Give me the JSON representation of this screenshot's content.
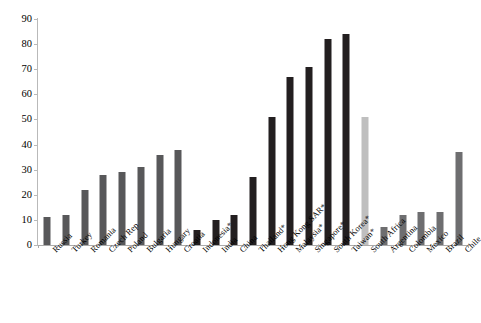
{
  "chart_data": {
    "type": "bar",
    "title": "",
    "subtitle": "",
    "xlabel": "",
    "ylabel": "",
    "ylim": [
      0,
      90
    ],
    "ytick_step": 10,
    "yticks": [
      0,
      10,
      20,
      30,
      40,
      50,
      60,
      70,
      80,
      90
    ],
    "ytick_labels": [
      "0",
      "10",
      "20",
      "30",
      "40",
      "50",
      "60",
      "70",
      "80",
      "90"
    ],
    "grid": false,
    "legend": null,
    "legend_position": "none",
    "categories": [
      "Russia",
      "Turkey",
      "Romania",
      "Czech Rep",
      "Poland",
      "Bulgaria",
      "Hungary",
      "Croatia",
      "Indonesia*",
      "India",
      "China",
      "Thailand*",
      "Hong Kong SAR*",
      "Malaysia*",
      "Singapore*",
      "South Korea*",
      "Taiwan*",
      "South Africa",
      "Argentina",
      "Colombia",
      "Mexico",
      "Brazil",
      "Chile"
    ],
    "values": [
      11,
      12,
      22,
      28,
      29,
      31,
      36,
      38,
      6,
      10,
      12,
      27,
      51,
      67,
      71,
      82,
      84,
      51,
      7,
      12,
      13,
      13,
      37
    ],
    "bar_colors": [
      "#58585a",
      "#58585a",
      "#58585a",
      "#58585a",
      "#58585a",
      "#58585a",
      "#58585a",
      "#58585a",
      "#231f20",
      "#231f20",
      "#231f20",
      "#231f20",
      "#231f20",
      "#231f20",
      "#231f20",
      "#231f20",
      "#231f20",
      "#bfbfbf",
      "#6e6e70",
      "#6e6e70",
      "#6e6e70",
      "#6e6e70",
      "#6e6e70"
    ]
  },
  "footer": {
    "note": ""
  }
}
